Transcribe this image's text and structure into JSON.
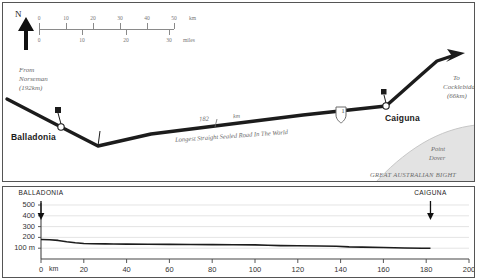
{
  "map": {
    "north_label": "N",
    "north_icon": "north-arrow-icon",
    "scale": {
      "km_unit": "km",
      "miles_unit": "miles",
      "km_ticks": [
        "0",
        "10",
        "20",
        "30",
        "40",
        "50"
      ],
      "mile_ticks": [
        "0",
        "10",
        "20",
        "30"
      ]
    },
    "origin_note": "From\nNorseman\n(192km)",
    "origin_note_lines": [
      "From",
      "Norseman",
      "(192km)"
    ],
    "destination_note_lines": [
      "To",
      "Cocklebiddy",
      "(66km)"
    ],
    "towns": [
      {
        "name": "Balladonia",
        "marker": "roadhouse-marker"
      },
      {
        "name": "Caiguna",
        "marker": "roadhouse-marker"
      }
    ],
    "road_distance": "182",
    "road_distance_unit": "km",
    "road_caption": "Longest Straight Sealed Road In The World",
    "highway_shield_number": "1",
    "sea_label_lines": [
      "Point",
      "Dover"
    ],
    "bight_label": "GREAT   AUSTRALIAN   BIGHT",
    "colors": {
      "road": "#1c1c1c",
      "sea": "#e2e2e2",
      "text_muted": "#6b6b6b",
      "border": "#555555"
    }
  },
  "chart_data": {
    "type": "line",
    "title": "",
    "xlabel": "km",
    "ylabel": "m",
    "xlim": [
      0,
      200
    ],
    "ylim": [
      0,
      500
    ],
    "grid": true,
    "legend_position": "none",
    "xticks": [
      "0",
      "20",
      "40",
      "60",
      "80",
      "100",
      "120",
      "140",
      "160",
      "180",
      "200"
    ],
    "xtick_values": [
      0,
      20,
      40,
      60,
      80,
      100,
      120,
      140,
      160,
      180,
      200
    ],
    "yticks": [
      "100 m",
      "200",
      "300",
      "400",
      "500"
    ],
    "ytick_values": [
      100,
      200,
      300,
      400,
      500
    ],
    "x": [
      0,
      4,
      8,
      12,
      16,
      20,
      24,
      30,
      34,
      40,
      50,
      60,
      70,
      80,
      90,
      100,
      106,
      112,
      120,
      130,
      138,
      144,
      150,
      160,
      170,
      178,
      182
    ],
    "values": [
      180,
      178,
      172,
      160,
      150,
      143,
      141,
      140,
      139,
      138,
      136,
      135,
      134,
      133,
      132,
      131,
      128,
      124,
      122,
      120,
      118,
      112,
      110,
      106,
      102,
      100,
      100
    ],
    "annotations": [
      {
        "label": "BALLADONIA",
        "x": 0,
        "marker": "down-arrow"
      },
      {
        "label": "CAIGUNA",
        "x": 182,
        "marker": "down-arrow"
      }
    ]
  }
}
